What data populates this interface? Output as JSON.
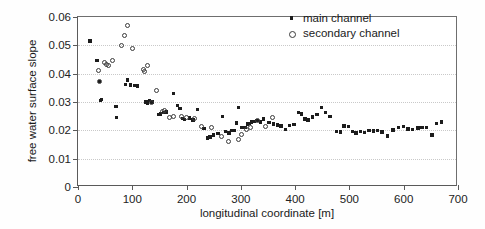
{
  "chart_data": {
    "type": "scatter",
    "title": "",
    "xlabel": "longitudinal coordinate [m]",
    "ylabel": "free water surface slope",
    "xlim": [
      0,
      700
    ],
    "ylim": [
      0,
      0.06
    ],
    "xticks": [
      "0",
      "100",
      "200",
      "300",
      "400",
      "500",
      "600",
      "700"
    ],
    "xtick_values": [
      0,
      100,
      200,
      300,
      400,
      500,
      600,
      700
    ],
    "yticks": [
      "0",
      "0.01",
      "0.02",
      "0.03",
      "0.04",
      "0.05",
      "0.06"
    ],
    "ytick_values": [
      0,
      0.01,
      0.02,
      0.03,
      0.04,
      0.05,
      0.06
    ],
    "grid": "horizontal-dotted",
    "legend_position": "top-right",
    "series": [
      {
        "name": "main channel",
        "marker": "filled-square",
        "color": "#1c1c1c",
        "points": [
          [
            22,
            0.0516
          ],
          [
            35,
            0.0447
          ],
          [
            40,
            0.0372
          ],
          [
            41,
            0.0305
          ],
          [
            43,
            0.0308
          ],
          [
            70,
            0.0285
          ],
          [
            71,
            0.0245
          ],
          [
            88,
            0.0361
          ],
          [
            91,
            0.0377
          ],
          [
            97,
            0.036
          ],
          [
            104,
            0.0358
          ],
          [
            110,
            0.0357
          ],
          [
            125,
            0.03
          ],
          [
            128,
            0.0296
          ],
          [
            132,
            0.0305
          ],
          [
            136,
            0.03
          ],
          [
            148,
            0.0256
          ],
          [
            152,
            0.0258
          ],
          [
            158,
            0.0262
          ],
          [
            163,
            0.0265
          ],
          [
            176,
            0.0331
          ],
          [
            183,
            0.0287
          ],
          [
            188,
            0.0277
          ],
          [
            192,
            0.0241
          ],
          [
            196,
            0.0238
          ],
          [
            205,
            0.0244
          ],
          [
            212,
            0.0236
          ],
          [
            220,
            0.0274
          ],
          [
            232,
            0.0206
          ],
          [
            238,
            0.0173
          ],
          [
            243,
            0.0176
          ],
          [
            250,
            0.0183
          ],
          [
            258,
            0.0189
          ],
          [
            266,
            0.0248
          ],
          [
            272,
            0.0196
          ],
          [
            278,
            0.019
          ],
          [
            283,
            0.0199
          ],
          [
            288,
            0.02
          ],
          [
            292,
            0.0226
          ],
          [
            296,
            0.0281
          ],
          [
            302,
            0.0209
          ],
          [
            308,
            0.0211
          ],
          [
            312,
            0.0223
          ],
          [
            316,
            0.0225
          ],
          [
            320,
            0.0229
          ],
          [
            324,
            0.0231
          ],
          [
            330,
            0.0234
          ],
          [
            336,
            0.023
          ],
          [
            342,
            0.024
          ],
          [
            352,
            0.0228
          ],
          [
            360,
            0.0222
          ],
          [
            367,
            0.0219
          ],
          [
            374,
            0.0215
          ],
          [
            382,
            0.0204
          ],
          [
            390,
            0.0218
          ],
          [
            398,
            0.0221
          ],
          [
            406,
            0.0263
          ],
          [
            412,
            0.0258
          ],
          [
            418,
            0.024
          ],
          [
            424,
            0.0236
          ],
          [
            432,
            0.0247
          ],
          [
            440,
            0.0255
          ],
          [
            448,
            0.028
          ],
          [
            456,
            0.0264
          ],
          [
            464,
            0.0248
          ],
          [
            476,
            0.0196
          ],
          [
            483,
            0.0194
          ],
          [
            490,
            0.0215
          ],
          [
            498,
            0.0213
          ],
          [
            506,
            0.0196
          ],
          [
            512,
            0.0191
          ],
          [
            520,
            0.0196
          ],
          [
            528,
            0.0192
          ],
          [
            536,
            0.02
          ],
          [
            544,
            0.0198
          ],
          [
            552,
            0.0199
          ],
          [
            560,
            0.0194
          ],
          [
            570,
            0.018
          ],
          [
            580,
            0.0201
          ],
          [
            590,
            0.0209
          ],
          [
            600,
            0.0214
          ],
          [
            608,
            0.0205
          ],
          [
            616,
            0.0204
          ],
          [
            626,
            0.0208
          ],
          [
            634,
            0.0209
          ],
          [
            642,
            0.021
          ],
          [
            652,
            0.0184
          ],
          [
            660,
            0.0224
          ],
          [
            670,
            0.0229
          ]
        ]
      },
      {
        "name": "secondary channel",
        "marker": "open-circle",
        "color": "#3a3a3a",
        "points": [
          [
            38,
            0.041
          ],
          [
            40,
            0.0371
          ],
          [
            48,
            0.0438
          ],
          [
            52,
            0.0432
          ],
          [
            57,
            0.043
          ],
          [
            64,
            0.0448
          ],
          [
            80,
            0.05
          ],
          [
            86,
            0.0534
          ],
          [
            92,
            0.057
          ],
          [
            100,
            0.049
          ],
          [
            120,
            0.0415
          ],
          [
            122,
            0.0408
          ],
          [
            128,
            0.0428
          ],
          [
            136,
            0.03
          ],
          [
            144,
            0.0339
          ],
          [
            156,
            0.0268
          ],
          [
            160,
            0.0271
          ],
          [
            168,
            0.0247
          ],
          [
            176,
            0.025
          ],
          [
            190,
            0.0249
          ],
          [
            200,
            0.0245
          ],
          [
            214,
            0.0241
          ],
          [
            228,
            0.0215
          ],
          [
            246,
            0.0211
          ],
          [
            264,
            0.0179
          ],
          [
            278,
            0.016
          ],
          [
            296,
            0.0169
          ],
          [
            302,
            0.0184
          ],
          [
            310,
            0.0203
          ],
          [
            318,
            0.0209
          ],
          [
            330,
            0.0236
          ],
          [
            346,
            0.0213
          ],
          [
            358,
            0.0245
          ]
        ]
      }
    ]
  },
  "legend": {
    "items": [
      {
        "label": "main channel",
        "marker": "filled-square"
      },
      {
        "label": "secondary channel",
        "marker": "open-circle"
      }
    ]
  }
}
